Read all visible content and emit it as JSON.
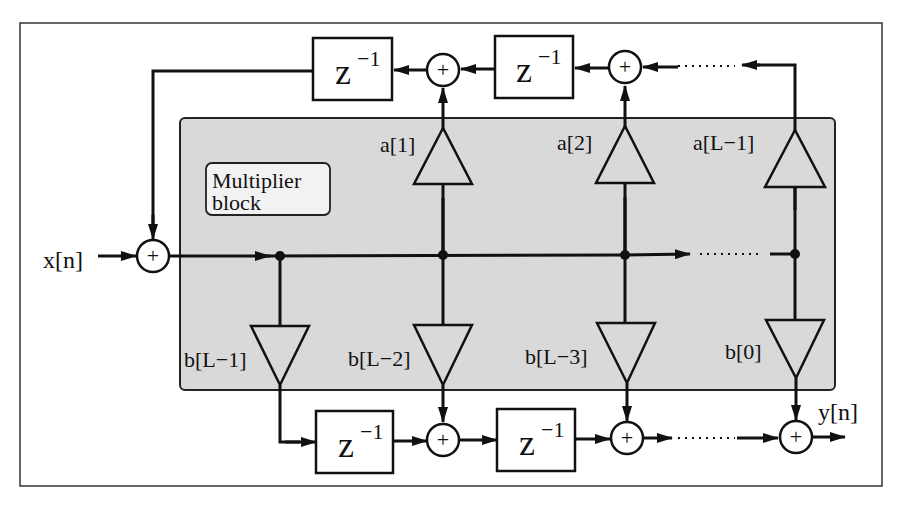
{
  "diagram": {
    "colors": {
      "background": "#ffffff",
      "block_fill": "#d9d9d9",
      "stroke": "#111111"
    },
    "multiplier_block": {
      "label_line1": "Multiplier",
      "label_line2": "block"
    },
    "input": {
      "label": "x[n]"
    },
    "output": {
      "label": "y[n]"
    },
    "delay": {
      "base": "z",
      "exponent": "−1"
    },
    "feedback_coefficients": [
      "a[1]",
      "a[2]",
      "a[L−1]"
    ],
    "feedforward_coefficients": [
      "b[L−1]",
      "b[L−2]",
      "b[L−3]",
      "b[0]"
    ],
    "adder_symbol": "+",
    "ellipsis": "……"
  }
}
